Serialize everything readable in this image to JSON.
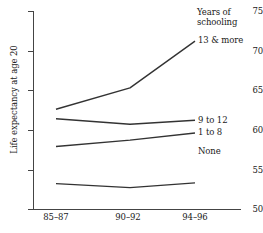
{
  "chart_data": {
    "type": "line",
    "title": "",
    "xlabel": "",
    "ylabel": "Life expectancy at age 20",
    "categories": [
      "85–87",
      "90–92",
      "94–96"
    ],
    "ylim": [
      50,
      75
    ],
    "yticks": [
      50,
      55,
      60,
      65,
      70,
      75
    ],
    "grid": false,
    "legend_position": "right-of-line-ends",
    "legend_title": "Years of schooling",
    "series": [
      {
        "name": "13 & more",
        "values": [
          62.6,
          65.3,
          71.2
        ]
      },
      {
        "name": "9 to 12",
        "values": [
          61.4,
          60.7,
          61.2
        ]
      },
      {
        "name": "1 to 8",
        "values": [
          57.9,
          58.7,
          59.6
        ]
      },
      {
        "name": "None",
        "values": [
          53.2,
          52.7,
          53.3
        ]
      }
    ]
  },
  "axis": {
    "y_title": "Life expectancy at age 20",
    "y_tick_labels": [
      "75",
      "70",
      "65",
      "60",
      "55",
      "50"
    ],
    "x_tick_labels": [
      "85–87",
      "90–92",
      "94–96"
    ]
  },
  "legend": {
    "title_line1": "Years of",
    "title_line2": "schooling",
    "items": [
      {
        "label": "13 & more"
      },
      {
        "label": "9 to 12"
      },
      {
        "label": "1 to 8"
      },
      {
        "label": "None"
      }
    ]
  },
  "style": {
    "line_color": "#333333",
    "axis_color": "#444444",
    "background": "#ffffff"
  }
}
